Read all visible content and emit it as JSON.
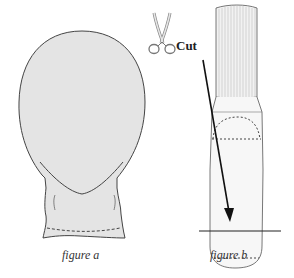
{
  "figures": {
    "a": {
      "caption": "figure a"
    },
    "b": {
      "caption": "figure b",
      "cut_label": "Cut"
    }
  },
  "icons": [
    "scissors-icon",
    "arrow-icon"
  ],
  "colors": {
    "fill": "#e4e4e4",
    "stroke": "#444444",
    "background": "#ffffff"
  }
}
